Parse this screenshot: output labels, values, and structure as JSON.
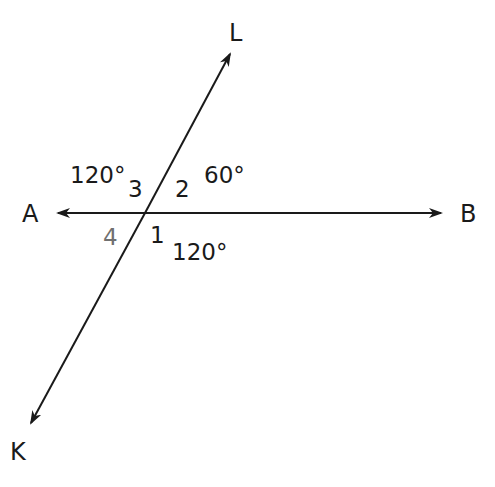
{
  "diagram": {
    "type": "intersecting-lines",
    "intersection": {
      "x": 145,
      "y": 213
    },
    "lines": [
      {
        "name": "AB",
        "from": {
          "x": 58,
          "y": 213
        },
        "to": {
          "x": 441,
          "y": 213
        },
        "arrows": "both"
      },
      {
        "name": "KL",
        "from": {
          "x": 31,
          "y": 423
        },
        "to": {
          "x": 230,
          "y": 54
        },
        "arrows": "both"
      }
    ],
    "points": {
      "L": "L",
      "A": "A",
      "B": "B",
      "K": "K"
    },
    "angle_numbers": {
      "n1": "1",
      "n2": "2",
      "n3": "3",
      "n4": "4"
    },
    "angle_measures": {
      "angle3": "120°",
      "angle2": "60°",
      "angle1": "120°"
    },
    "colors": {
      "line": "#1a1a1a",
      "text": "#1a1a1a",
      "label4": "#707070",
      "background": "#ffffff"
    }
  }
}
